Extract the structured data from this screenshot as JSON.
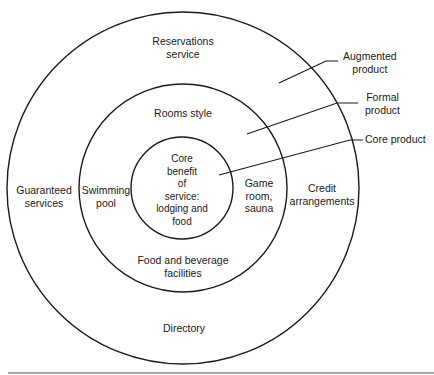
{
  "diagram": {
    "type": "concentric-circles",
    "rings": [
      {
        "id": "core",
        "name": "Core product",
        "radius": 51
      },
      {
        "id": "formal",
        "name": "Formal product",
        "radius": 104
      },
      {
        "id": "augmented",
        "name": "Augmented product",
        "radius": 176
      }
    ],
    "core_text": [
      "Core",
      "benefit",
      "of",
      "service:",
      "lodging and",
      "food"
    ],
    "formal_items": {
      "top": "Rooms style",
      "left": [
        "Swimming",
        "pool"
      ],
      "right": [
        "Game",
        "room,",
        "sauna"
      ],
      "bottom": [
        "Food and beverage",
        "facilities"
      ]
    },
    "augmented_items": {
      "top": [
        "Reservations",
        "service"
      ],
      "left": [
        "Guaranteed",
        "services"
      ],
      "right": [
        "Credit",
        "arrangements"
      ],
      "bottom": "Directory"
    },
    "callouts": [
      {
        "lines": [
          "Augmented",
          "product"
        ]
      },
      {
        "lines": [
          "Formal",
          "product"
        ]
      },
      {
        "lines": [
          "Core product"
        ]
      }
    ],
    "colors": {
      "stroke": "#1a1a1a",
      "rule": "#8a8a8a",
      "background": "#ffffff"
    }
  }
}
